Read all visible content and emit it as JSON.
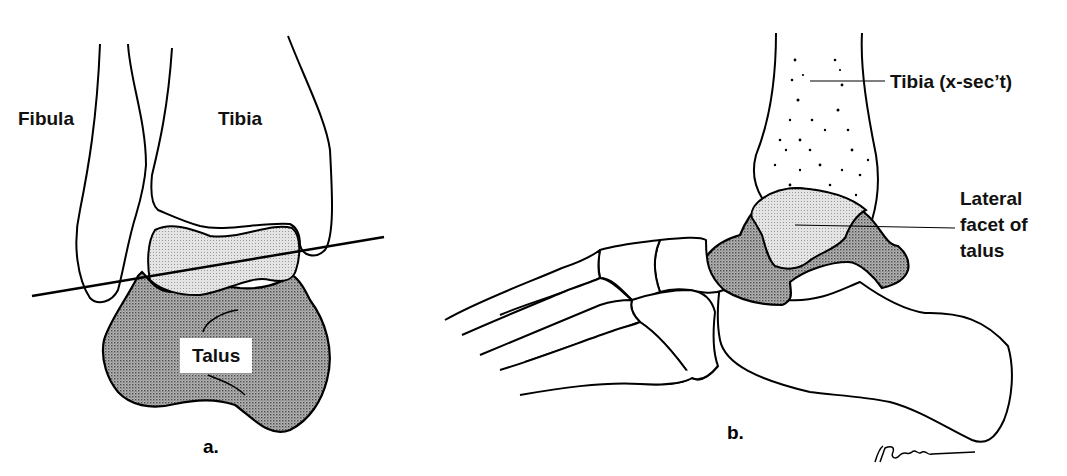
{
  "figure": {
    "panel_a": {
      "caption": "a.",
      "labels": {
        "fibula": "Fibula",
        "tibia": "Tibia",
        "talus": "Talus"
      }
    },
    "panel_b": {
      "caption": "b.",
      "labels": {
        "tibia_xsect": "Tibia (x-sec’t)",
        "lateral_facet_line1": "Lateral",
        "lateral_facet_line2": "facet of",
        "lateral_facet_line3": "talus"
      },
      "signature": "V.Farnham"
    },
    "colors": {
      "line": "#000000",
      "light_fill": "#dcdcdc",
      "dark_fill": "#9a9a9a",
      "background": "#ffffff"
    }
  }
}
